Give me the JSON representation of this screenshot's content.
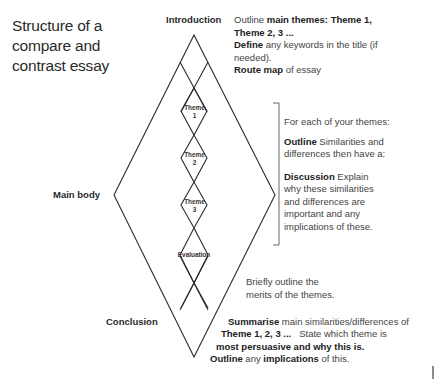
{
  "title": {
    "line1": "Structure of a",
    "line2": "compare and",
    "line3": "contrast essay"
  },
  "sections": {
    "introduction": {
      "label": "Introduction",
      "desc": {
        "l1_plain": "Outline ",
        "l1_bold": "main themes: Theme 1,",
        "l2_bold": "Theme 2, 3 ...",
        "l3_bold": "Define",
        "l3_plain": " any keywords in the title (if",
        "l4_plain": "needed).",
        "l5_bold": "Route map",
        "l5_plain": " of essay"
      }
    },
    "main_body": {
      "label": "Main body",
      "desc": {
        "p1": "For each of your themes:",
        "p2_bold": "Outline",
        "p2_l1": "  Similarities and",
        "p2_l2": "differences then have a:",
        "p3_bold": "Discussion",
        "p3_l1": "  Explain",
        "p3_l2": "why these similarities",
        "p3_l3": "and differences are",
        "p3_l4": "important and any",
        "p3_l5": "implications of these."
      }
    },
    "nodes": [
      {
        "word": "Theme",
        "num": "1"
      },
      {
        "word": "Theme",
        "num": "2"
      },
      {
        "word": "Theme",
        "num": "3"
      },
      {
        "word": "Evaluation",
        "num": ""
      }
    ],
    "evaluation": {
      "l1": "Briefly outline the",
      "l2": "merits of the themes."
    },
    "conclusion": {
      "label": "Conclusion",
      "desc": {
        "l1_bold": "Summarise",
        "l1_plain": " main similarities/differences of",
        "l2_bold": "Theme 1, 2, 3 ...",
        "l2_plain": "   State which theme is",
        "l3_bold": "most persuasive and why this is.",
        "l4_bold1": "Outline",
        "l4_plain1": " any ",
        "l4_bold2": "implications",
        "l4_plain2": " of this."
      }
    }
  },
  "colors": {
    "line": "#2b2b2b",
    "bracket": "#555555",
    "text": "#444444"
  }
}
